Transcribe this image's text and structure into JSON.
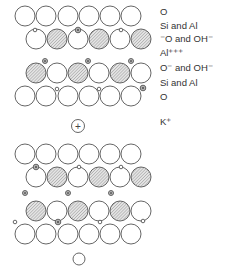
{
  "labels": [
    {
      "text": "O",
      "y": 11
    },
    {
      "text": "Si and Al",
      "y": 25
    },
    {
      "text": "⁻O and OH⁻",
      "y": 38
    },
    {
      "text": "Al⁺⁺⁺",
      "y": 52
    },
    {
      "text": "O⁻ and OH⁻",
      "y": 67
    },
    {
      "text": "Si and Al",
      "y": 82
    },
    {
      "text": "O",
      "y": 96
    },
    {
      "text": "K⁺",
      "y": 121
    }
  ],
  "legend_semantics": {
    "large_open_circle": "oxygen",
    "hatched_circle": "hydroxyl (OH-)",
    "small_open_circle": "Si",
    "small_dotted_circle": "Al",
    "plus_circle": "K+"
  },
  "colors": {
    "stroke": "#555555",
    "hatch": "#9a9a9a",
    "text": "#333333"
  }
}
